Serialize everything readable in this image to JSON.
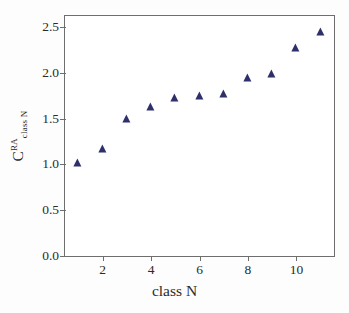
{
  "chart_data": {
    "type": "scatter",
    "title": "",
    "xlabel": "class N",
    "ylabel_base": "C",
    "ylabel_superscript": "RA",
    "ylabel_subscript": "class N",
    "ylabel_plain": "C_classN^RA",
    "x": [
      1,
      2,
      3,
      4,
      5,
      6,
      7,
      8,
      9,
      10,
      11
    ],
    "values": [
      1.0,
      1.16,
      1.48,
      1.62,
      1.71,
      1.74,
      1.76,
      1.93,
      1.98,
      2.26,
      2.43
    ],
    "xlim": [
      0.45,
      11.55
    ],
    "ylim": [
      0.0,
      2.62
    ],
    "xticks": [
      2,
      4,
      6,
      8,
      10
    ],
    "xtick_labels": [
      "2",
      "4",
      "6",
      "8",
      "10"
    ],
    "yticks": [
      0.0,
      0.5,
      1.0,
      1.5,
      2.0,
      2.5
    ],
    "ytick_labels": [
      "0.0",
      "0.5",
      "1.0",
      "1.5",
      "2.0",
      "2.5"
    ],
    "grid": false,
    "legend": null,
    "marker": "triangle",
    "marker_color": "#2e2f6b",
    "frame_color": "#6e6e6e",
    "background": "#ffffff"
  }
}
